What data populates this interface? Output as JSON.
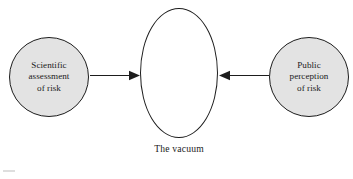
{
  "diagram": {
    "background_color": "#ffffff",
    "stroke_color": "#1d1d1d",
    "node_fill_color": "#e3e3e3",
    "ellipse_fill_color": "#ffffff",
    "nodes": [
      {
        "id": "scientific-assessment",
        "shape": "circle",
        "label": "Scientific\nassessment\nof risk"
      },
      {
        "id": "the-vacuum",
        "shape": "ellipse",
        "label": ""
      },
      {
        "id": "public-perception",
        "shape": "circle",
        "label": "Public\nperception\nof risk"
      }
    ],
    "caption": "The vacuum",
    "arrows": [
      {
        "id": "arrow-left",
        "from": "scientific-assessment",
        "to": "the-vacuum",
        "direction": "right"
      },
      {
        "id": "arrow-right",
        "from": "public-perception",
        "to": "the-vacuum",
        "direction": "left"
      }
    ]
  }
}
